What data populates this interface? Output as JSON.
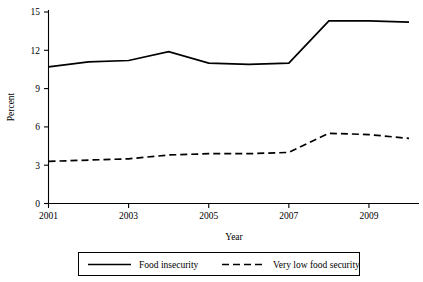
{
  "chart_data": {
    "type": "line",
    "title": "",
    "xlabel": "Year",
    "ylabel": "Percent",
    "xlim": [
      2001,
      2010
    ],
    "ylim": [
      0,
      15
    ],
    "yticks": [
      0,
      3,
      6,
      9,
      12,
      15
    ],
    "ytick_labels": [
      "0",
      "3",
      "6",
      "9",
      "12",
      "15"
    ],
    "xticks": [
      2001,
      2003,
      2005,
      2007,
      2009
    ],
    "xtick_labels": [
      "2001",
      "2003",
      "2005",
      "2007",
      "2009"
    ],
    "grid": false,
    "legend_position": "below",
    "x": [
      2001,
      2002,
      2003,
      2004,
      2005,
      2006,
      2007,
      2008,
      2009,
      2010
    ],
    "series": [
      {
        "name": "Food insecurity",
        "style": "solid",
        "color": "#000000",
        "values": [
          10.7,
          11.1,
          11.2,
          11.9,
          11.0,
          10.9,
          11.0,
          14.3,
          14.3,
          14.2
        ]
      },
      {
        "name": "Very low food security",
        "style": "dashed",
        "color": "#000000",
        "values": [
          3.3,
          3.4,
          3.5,
          3.8,
          3.9,
          3.9,
          4.0,
          5.5,
          5.4,
          5.1
        ]
      }
    ]
  },
  "legend": {
    "items": [
      {
        "label": "Food insecurity",
        "style": "solid"
      },
      {
        "label": "Very low food security",
        "style": "dashed"
      }
    ]
  },
  "axes": {
    "y_title": "Percent",
    "x_title": "Year"
  }
}
